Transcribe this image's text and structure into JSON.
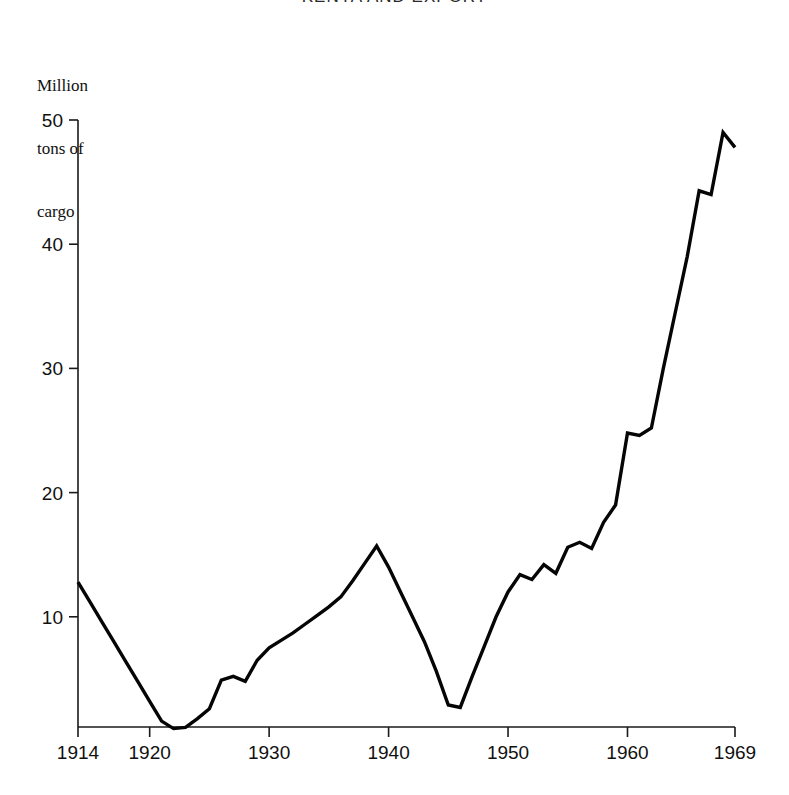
{
  "figure": {
    "title_clipped": "KENYA AND EXPORT",
    "axis_caption_line1": "Million",
    "axis_caption_line2": "tons of",
    "axis_caption_line3": "cargo",
    "line_color": "#050505",
    "axis_color": "#1a1a1a",
    "background": "#ffffff"
  },
  "chart_data": {
    "type": "line",
    "title": "KENYA AND EXPORT",
    "xlabel": "",
    "ylabel": "Million tons of cargo",
    "ylim": [
      0,
      50
    ],
    "xlim": [
      1914,
      1969
    ],
    "grid": false,
    "legend": null,
    "y_ticks": [
      10,
      20,
      30,
      40,
      50
    ],
    "x_ticks": [
      1914,
      1920,
      1930,
      1940,
      1950,
      1960,
      1969
    ],
    "x": [
      1914,
      1915,
      1916,
      1917,
      1918,
      1919,
      1920,
      1921,
      1922,
      1923,
      1924,
      1925,
      1926,
      1927,
      1928,
      1929,
      1930,
      1931,
      1932,
      1933,
      1934,
      1935,
      1936,
      1937,
      1938,
      1939,
      1940,
      1941,
      1942,
      1943,
      1944,
      1945,
      1946,
      1947,
      1948,
      1949,
      1950,
      1951,
      1952,
      1953,
      1954,
      1955,
      1956,
      1957,
      1958,
      1959,
      1960,
      1961,
      1962,
      1963,
      1964,
      1965,
      1966,
      1967,
      1968,
      1969
    ],
    "values": [
      12.8,
      11.2,
      9.6,
      8.0,
      6.4,
      4.8,
      3.2,
      1.6,
      1.0,
      1.1,
      1.8,
      2.6,
      4.9,
      5.2,
      4.8,
      6.5,
      7.5,
      8.1,
      8.7,
      9.4,
      10.1,
      10.8,
      11.6,
      12.9,
      14.3,
      15.7,
      14.0,
      12.0,
      10.0,
      8.0,
      5.6,
      2.9,
      2.7,
      5.2,
      7.6,
      10.0,
      12.0,
      13.4,
      13.0,
      14.2,
      13.5,
      15.6,
      16.0,
      15.5,
      17.6,
      19.0,
      24.8,
      24.6,
      25.2,
      30.0,
      34.5,
      39.0,
      44.3,
      44.0,
      49.0,
      47.8
    ],
    "series_name": "cargo"
  },
  "geometry": {
    "plot_left": 78,
    "plot_right": 735,
    "plot_bottom": 727,
    "y_of_50": 120,
    "y_of_0": 741
  }
}
